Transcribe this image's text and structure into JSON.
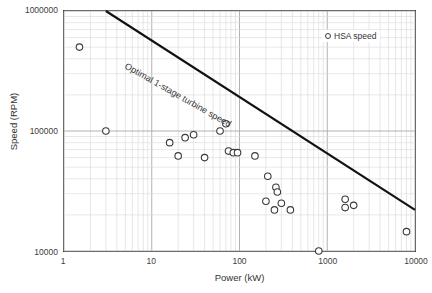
{
  "chart_data": {
    "type": "scatter",
    "title": "",
    "xlabel": "Power (kW)",
    "ylabel": "Speed (RPM)",
    "xscale": "log",
    "yscale": "log",
    "xlim": [
      1,
      10000
    ],
    "ylim": [
      10000,
      1000000
    ],
    "xticks": [
      "1",
      "10",
      "100",
      "1000",
      "10000"
    ],
    "xtick_values": [
      1,
      10,
      100,
      1000,
      10000
    ],
    "yticks": [
      "10000",
      "100000",
      "1000000"
    ],
    "ytick_values": [
      10000,
      100000,
      1000000
    ],
    "grid": "major and minor, light gray",
    "legend": {
      "position": "top-right inside",
      "entries": [
        "HSA speed"
      ]
    },
    "series": [
      {
        "name": "HSA speed",
        "marker": "open-circle",
        "marker_color": "#ffffff",
        "marker_edge_color": "#3a3a3a",
        "points": [
          {
            "power_kw": 1.5,
            "speed_rpm": 500000
          },
          {
            "power_kw": 3.0,
            "speed_rpm": 100000
          },
          {
            "power_kw": 16,
            "speed_rpm": 80000
          },
          {
            "power_kw": 20,
            "speed_rpm": 62000
          },
          {
            "power_kw": 24,
            "speed_rpm": 88000
          },
          {
            "power_kw": 30,
            "speed_rpm": 93000
          },
          {
            "power_kw": 40,
            "speed_rpm": 60000
          },
          {
            "power_kw": 60,
            "speed_rpm": 100000
          },
          {
            "power_kw": 70,
            "speed_rpm": 115000
          },
          {
            "power_kw": 75,
            "speed_rpm": 68000
          },
          {
            "power_kw": 85,
            "speed_rpm": 66000
          },
          {
            "power_kw": 95,
            "speed_rpm": 66000
          },
          {
            "power_kw": 150,
            "speed_rpm": 62000
          },
          {
            "power_kw": 210,
            "speed_rpm": 42000
          },
          {
            "power_kw": 260,
            "speed_rpm": 34000
          },
          {
            "power_kw": 270,
            "speed_rpm": 31000
          },
          {
            "power_kw": 200,
            "speed_rpm": 26000
          },
          {
            "power_kw": 250,
            "speed_rpm": 22000
          },
          {
            "power_kw": 300,
            "speed_rpm": 25000
          },
          {
            "power_kw": 380,
            "speed_rpm": 22000
          },
          {
            "power_kw": 800,
            "speed_rpm": 10000
          },
          {
            "power_kw": 1600,
            "speed_rpm": 27000
          },
          {
            "power_kw": 1600,
            "speed_rpm": 23000
          },
          {
            "power_kw": 2000,
            "speed_rpm": 24000
          },
          {
            "power_kw": 8000,
            "speed_rpm": 14500
          }
        ]
      }
    ],
    "annotations": [
      {
        "type": "line",
        "label": "Optimal 1-stage turbine speed",
        "color": "#111111",
        "start": {
          "power_kw": 3.0,
          "speed_rpm": 1000000
        },
        "end": {
          "power_kw": 10000,
          "speed_rpm": 22000
        }
      }
    ]
  },
  "axes": {
    "x_title": "Power (kW)",
    "y_title": "Speed (RPM)"
  },
  "legend": {
    "entry_label": "HSA speed"
  },
  "annotation": {
    "trend_label": "Optimal 1-stage turbine speed"
  }
}
